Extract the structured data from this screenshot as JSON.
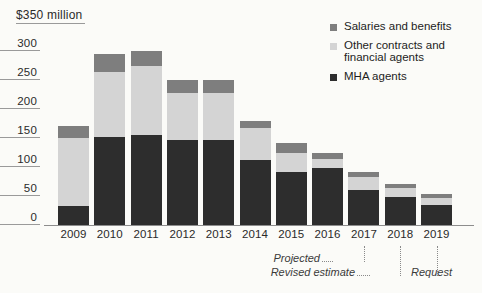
{
  "chart_data": {
    "type": "bar",
    "stacked": true,
    "title": "",
    "subtitle": "",
    "xlabel": "",
    "ylabel": "$350 million",
    "unit": "$ million",
    "grid": true,
    "legend_position": "top-right",
    "ylim": [
      0,
      350
    ],
    "yticks": [
      0,
      50,
      100,
      150,
      200,
      250,
      300,
      350
    ],
    "ytick_labels": [
      "0",
      "50",
      "100",
      "150",
      "200",
      "250",
      "300",
      "$350 million"
    ],
    "categories": [
      "2009",
      "2010",
      "2011",
      "2012",
      "2013",
      "2014",
      "2015",
      "2016",
      "2017",
      "2018",
      "2019"
    ],
    "series": [
      {
        "name": "MHA agents",
        "color": "#2d2d2d",
        "values": [
          33,
          152,
          155,
          147,
          147,
          112,
          91,
          98,
          60,
          48,
          34
        ]
      },
      {
        "name": "Other contracts and financial agents",
        "color": "#d4d4d4",
        "values": [
          117,
          112,
          120,
          81,
          81,
          55,
          34,
          16,
          22,
          16,
          12
        ]
      },
      {
        "name": "Salaries and benefits",
        "color": "#7e7e7e",
        "values": [
          20,
          31,
          25,
          22,
          22,
          12,
          16,
          10,
          9,
          7,
          7
        ]
      }
    ],
    "totals": [
      170,
      295,
      300,
      250,
      250,
      179,
      141,
      124,
      91,
      71,
      53
    ],
    "annotations": [
      {
        "label": "Projected",
        "category": "2017"
      },
      {
        "label": "Revised estimate",
        "category": "2018"
      },
      {
        "label": "Request",
        "category": "2019"
      }
    ]
  },
  "legend": {
    "items": [
      {
        "label": "Salaries and benefits",
        "swatch": "legend-swatch-salaries"
      },
      {
        "label": "Other contracts and financial agents",
        "swatch": "legend-swatch-other"
      },
      {
        "label": "MHA agents",
        "swatch": "legend-swatch-mha"
      }
    ]
  },
  "colors": {
    "salaries": "#7e7e7e",
    "other": "#d4d4d4",
    "mha": "#2d2d2d",
    "background": "#fbfbf8",
    "axis": "#8d8d8d"
  }
}
